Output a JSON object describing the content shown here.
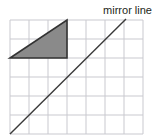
{
  "figure": {
    "title": "",
    "type": "geometry-reflection-diagram",
    "background_color": "#ffffff"
  },
  "labels": {
    "mirror_line": "mirror line"
  },
  "grid": {
    "name": "square-grid",
    "columns": 7,
    "rows": 6,
    "cell_width": 19,
    "cell_height": 19,
    "origin_x": 10,
    "origin_y": 20,
    "line_color": "#c9c9cf",
    "line_width": 1
  },
  "shapes": {
    "triangle": {
      "name": "shaded-triangle",
      "fill_color": "#8a8a8a",
      "stroke_color": "#333333",
      "stroke_width": 1.6,
      "points": "10,58 67,58 67,20",
      "description": "right triangle, 3 cells wide and 2 cells tall, right angle at bottom right"
    },
    "mirror_line": {
      "name": "mirror-line",
      "stroke_color": "#3a3a3a",
      "stroke_width": 1.4,
      "x1": 10,
      "y1": 134,
      "x2": 126,
      "y2": 19
    }
  },
  "label_positions": {
    "mirror_line_x": 152,
    "mirror_line_y": 14
  }
}
